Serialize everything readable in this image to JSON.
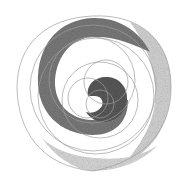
{
  "artwork": {
    "title": "Spiral of circles pencil drawing",
    "colors": {
      "background": "#ffffff",
      "line": "#9a9a9a",
      "dark_shade": "#6e6e6e",
      "core_shade": "#5a5a5a",
      "light_shade": "#cfcfcf"
    }
  }
}
